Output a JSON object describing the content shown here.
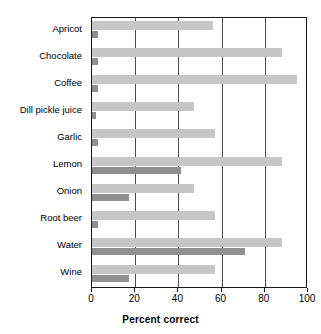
{
  "chart_data": {
    "type": "bar",
    "orientation": "horizontal",
    "title": "",
    "xlabel": "Percent correct",
    "ylabel": "",
    "xlim": [
      0,
      100
    ],
    "xticks": [
      0,
      20,
      40,
      60,
      80,
      100
    ],
    "xticklabels": [
      "0",
      "20",
      "40",
      "60",
      "80",
      "100"
    ],
    "grid": "vertical gridlines at 20, 40, 60, 80",
    "legend": "none",
    "categories": [
      "Apricot",
      "Chocolate",
      "Coffee",
      "Dill pickle juice",
      "Garlic",
      "Lemon",
      "Onion",
      "Root beer",
      "Water",
      "Wine"
    ],
    "series": [
      {
        "name": "light",
        "color": "#c6c6c6",
        "values": [
          56,
          88,
          95,
          47,
          57,
          88,
          47,
          57,
          88,
          57
        ]
      },
      {
        "name": "dark",
        "color": "#8f8f8f",
        "values": [
          3,
          3,
          3,
          2,
          3,
          41,
          17,
          3,
          71,
          17
        ]
      }
    ]
  },
  "axis": {
    "x_title": "Percent correct"
  },
  "colors": {
    "light_bar": "#c6c6c6",
    "dark_bar": "#8f8f8f",
    "frame": "#1a1a1a",
    "gridline": "#4d4d4d",
    "background": "#ffffff"
  }
}
